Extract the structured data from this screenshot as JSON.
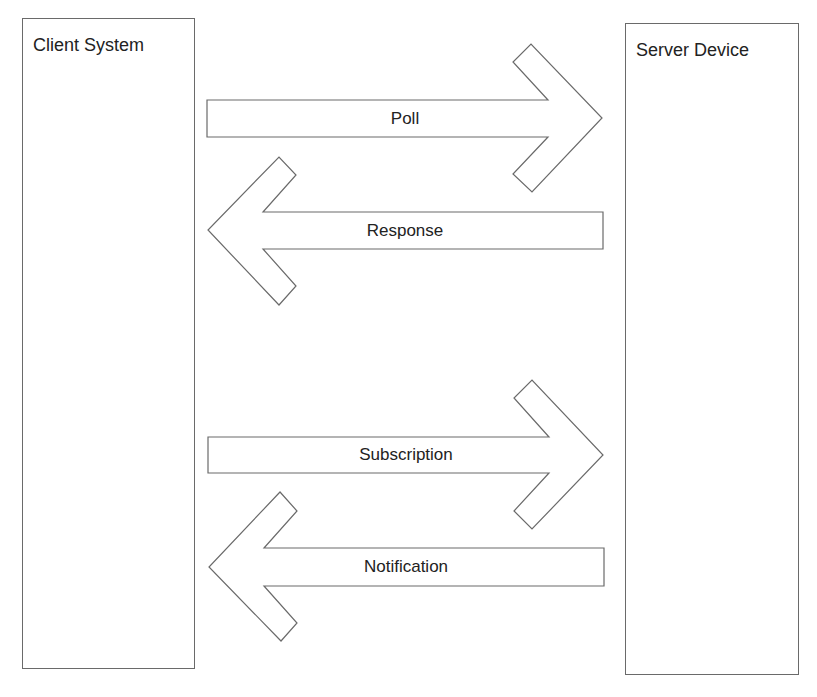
{
  "diagram": {
    "type": "sequence-interaction",
    "entities": {
      "client": {
        "label": "Client System"
      },
      "server": {
        "label": "Server Device"
      }
    },
    "messages": [
      {
        "label": "Poll",
        "from": "client",
        "to": "server",
        "direction": "right"
      },
      {
        "label": "Response",
        "from": "server",
        "to": "client",
        "direction": "left"
      },
      {
        "label": "Subscription",
        "from": "client",
        "to": "server",
        "direction": "right"
      },
      {
        "label": "Notification",
        "from": "server",
        "to": "client",
        "direction": "left"
      }
    ],
    "colors": {
      "stroke": "#6a6a6a",
      "fill": "#ffffff",
      "text": "#222222",
      "background": "#ffffff"
    }
  }
}
